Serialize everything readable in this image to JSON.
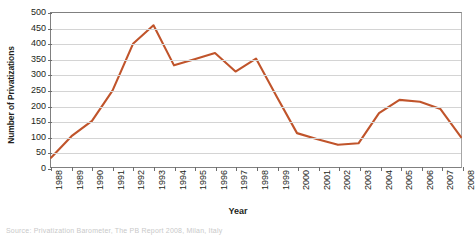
{
  "chart_data": {
    "type": "line",
    "title": "",
    "xlabel": "Year",
    "ylabel": "Number of Privatizations",
    "categories": [
      "1988",
      "1989",
      "1990",
      "1991",
      "1992",
      "1993",
      "1994",
      "1995",
      "1996",
      "1997",
      "1998",
      "1999",
      "2000",
      "2001",
      "2002",
      "2003",
      "2004",
      "2005",
      "2006",
      "2007",
      "2008"
    ],
    "values": [
      30,
      100,
      150,
      248,
      400,
      460,
      330,
      350,
      370,
      310,
      352,
      230,
      110,
      90,
      72,
      77,
      175,
      218,
      212,
      188,
      97
    ],
    "series": [
      {
        "name": "Number of Privatizations",
        "color": "#C0542B",
        "values": [
          30,
          100,
          150,
          248,
          400,
          460,
          330,
          350,
          370,
          310,
          352,
          230,
          110,
          90,
          72,
          77,
          175,
          218,
          212,
          188,
          97
        ]
      }
    ],
    "ylim": [
      0,
      500
    ],
    "ytick_values": [
      0,
      50,
      100,
      150,
      200,
      250,
      300,
      350,
      400,
      450,
      500
    ],
    "ytick_labels": [
      "0",
      "50",
      "100",
      "150",
      "200",
      "250",
      "300",
      "350",
      "400",
      "450",
      "500"
    ],
    "grid": "horizontal",
    "legend": "none",
    "line_color": "#C0542B",
    "gridline_color": "#D4D4D4",
    "axis_color": "#808080",
    "text_color": "#231F20"
  },
  "source_note": {
    "text": "Source: Privatization Barometer, The PB Report 2008, Milan, Italy"
  }
}
